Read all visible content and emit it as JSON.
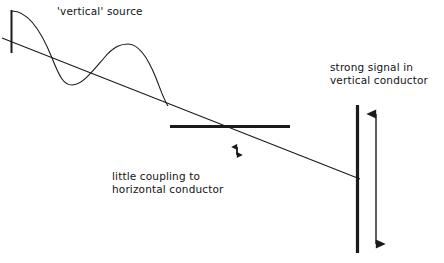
{
  "canvas": {
    "width": 444,
    "height": 263,
    "background": "#ffffff",
    "ink": "#1a1a1a"
  },
  "labels": {
    "source": "'vertical' source",
    "strong_signal_line1": "strong signal in",
    "strong_signal_line2": "vertical conductor",
    "little_coupling_line1": "little coupling to",
    "little_coupling_line2": "horizontal conductor"
  },
  "elements": {
    "source_antenna": {
      "name": "vertical source antenna",
      "x": 11,
      "y_top": 10,
      "y_bottom": 53,
      "thickness": 2
    },
    "propagation_line": {
      "name": "diagonal propagation path",
      "x1": 2,
      "y1": 38,
      "x2": 360,
      "y2": 179,
      "thickness": 1
    },
    "wave": {
      "name": "radiated sine wave",
      "start": {
        "x": 12,
        "y": 11
      },
      "trough": {
        "x": 72,
        "y": 85
      },
      "peak": {
        "x": 128,
        "y": 44
      },
      "end": {
        "x": 168,
        "y": 106
      },
      "thickness": 1
    },
    "horizontal_conductor": {
      "name": "horizontal conductor",
      "x1": 170,
      "x2": 290,
      "y": 126,
      "thickness": 3
    },
    "vertical_conductor": {
      "name": "vertical conductor",
      "x": 357,
      "y_top": 105,
      "y_bottom": 253,
      "thickness": 3
    },
    "small_arrow": {
      "name": "weak coupling indicator arrow",
      "x": 237,
      "y_top": 143,
      "y_bottom": 159,
      "thickness": 1.6
    },
    "large_arrow": {
      "name": "strong coupling indicator arrow",
      "x": 376,
      "y_top": 105,
      "y_bottom": 253,
      "thickness": 1.4
    }
  }
}
